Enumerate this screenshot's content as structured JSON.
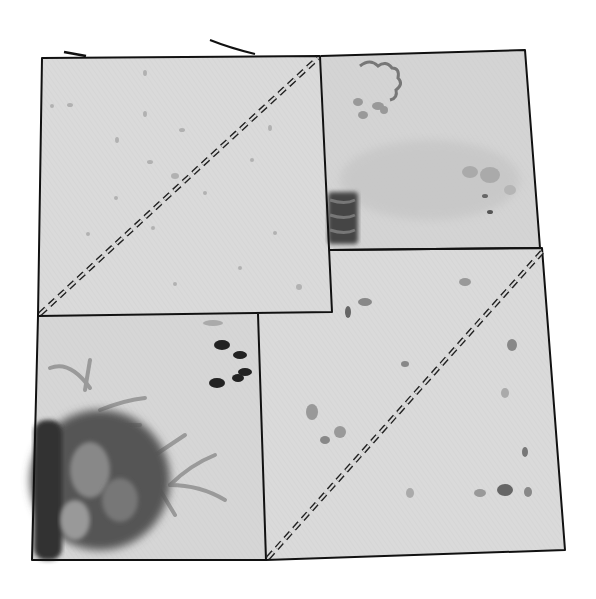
{
  "illustration": {
    "subject": "quilt block sketch",
    "style": "grayscale ink and watercolor",
    "background": "#ffffff",
    "ink_color": "#111111",
    "fabric_base": "#d9d9d9",
    "patches": [
      {
        "id": "top-left",
        "points": "42,58 320,56 332,312 38,316",
        "fill": "#dadada",
        "pattern": "speckled",
        "stitch_diagonal": {
          "x1": 40,
          "y1": 314,
          "x2": 318,
          "y2": 58
        }
      },
      {
        "id": "top-right",
        "points": "321,56 525,50 540,248 330,250",
        "fill": "#d2d2d2",
        "pattern": "floral-wash",
        "stitch_diagonal": null
      },
      {
        "id": "bottom-left",
        "points": "38,316 258,314 266,560 32,560",
        "fill": "#d6d6d6",
        "pattern": "floral-large",
        "stitch_diagonal": null
      },
      {
        "id": "bottom-right",
        "points": "330,250 542,248 565,550 266,560 258,314 332,312",
        "fill": "#dadada",
        "pattern": "speckled",
        "stitch_diagonal": {
          "x1": 268,
          "y1": 558,
          "x2": 542,
          "y2": 252
        }
      }
    ]
  }
}
